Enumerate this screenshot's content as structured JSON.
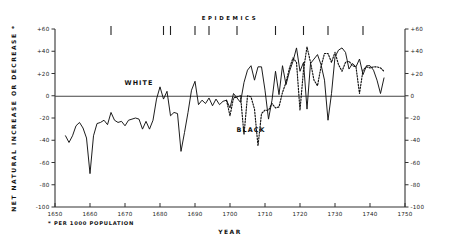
{
  "chart_data": {
    "type": "line",
    "title": "",
    "xlabel": "YEAR",
    "ylabel": "NET NATURAL INCREASE OR DECREASE *",
    "footnote": "* PER 1000 POPULATION",
    "annotation_epidemics_label": "EPIDEMICS",
    "xlim": [
      1650,
      1750
    ],
    "ylim": [
      -100,
      60
    ],
    "xticks": [
      1650,
      1660,
      1670,
      1680,
      1690,
      1700,
      1710,
      1720,
      1730,
      1740,
      1750
    ],
    "xticklabels": [
      "1650",
      "1660",
      "1670",
      "1680",
      "1690",
      "1700",
      "1710",
      "1720",
      "1730",
      "1740",
      "1750"
    ],
    "yticks": [
      60,
      40,
      20,
      0,
      -20,
      -40,
      -60,
      -80,
      -100
    ],
    "yticklabels": [
      "+60",
      "+40",
      "+20",
      "0",
      "-20",
      "-40",
      "-60",
      "-80",
      "-100"
    ],
    "right_axis_yticklabels": [
      "+60",
      "+40",
      "+20",
      "0",
      "-20",
      "-40",
      "-60",
      "-80",
      "-100"
    ],
    "grid": false,
    "legend_position": "inline-labels",
    "zero_line": 0,
    "epidemic_years": [
      1666,
      1681,
      1683,
      1690,
      1694,
      1702,
      1713,
      1721,
      1728,
      1738
    ],
    "series": [
      {
        "name": "WHITE",
        "style": "solid",
        "color": "#111111",
        "label_x": 1674,
        "label_y": 10,
        "x": [
          1653,
          1654,
          1655,
          1656,
          1657,
          1658,
          1659,
          1660,
          1661,
          1662,
          1663,
          1664,
          1665,
          1666,
          1667,
          1668,
          1669,
          1670,
          1671,
          1672,
          1673,
          1674,
          1675,
          1676,
          1677,
          1678,
          1679,
          1680,
          1681,
          1682,
          1683,
          1684,
          1685,
          1686,
          1687,
          1688,
          1689,
          1690,
          1691,
          1692,
          1693,
          1694,
          1695,
          1696,
          1697,
          1698,
          1699,
          1700,
          1701,
          1702,
          1703,
          1704,
          1705,
          1706,
          1707,
          1708,
          1709,
          1710,
          1711,
          1712,
          1713,
          1714,
          1715,
          1716,
          1717,
          1718,
          1719,
          1720,
          1721,
          1722,
          1723,
          1724,
          1725,
          1726,
          1727,
          1728,
          1729,
          1730,
          1731,
          1732,
          1733,
          1734,
          1735,
          1736,
          1737,
          1738,
          1739,
          1740,
          1741,
          1742,
          1743,
          1744
        ],
        "y": [
          -36,
          -42,
          -36,
          -27,
          -24,
          -29,
          -38,
          -70,
          -36,
          -25,
          -24,
          -22,
          -26,
          -15,
          -22,
          -24,
          -23,
          -27,
          -22,
          -21,
          -20,
          -21,
          -30,
          -23,
          -30,
          -22,
          -3,
          8,
          -3,
          4,
          -18,
          -15,
          -16,
          -50,
          -33,
          -15,
          5,
          13,
          -8,
          -4,
          -7,
          -2,
          -9,
          -3,
          -8,
          -5,
          -4,
          -11,
          2,
          -2,
          -6,
          12,
          23,
          27,
          14,
          26,
          26,
          5,
          -21,
          -4,
          22,
          1,
          27,
          10,
          22,
          31,
          43,
          22,
          30,
          -12,
          29,
          33,
          37,
          28,
          14,
          -22,
          2,
          35,
          41,
          43,
          39,
          24,
          29,
          26,
          33,
          19,
          27,
          27,
          23,
          14,
          2,
          16
        ]
      },
      {
        "name": "BLACK",
        "style": "dotted",
        "color": "#111111",
        "label_x": 1706,
        "label_y": -33,
        "x": [
          1699,
          1700,
          1701,
          1702,
          1703,
          1704,
          1705,
          1706,
          1707,
          1708,
          1709,
          1710,
          1711,
          1712,
          1713,
          1714,
          1715,
          1716,
          1717,
          1718,
          1719,
          1720,
          1721,
          1722,
          1723,
          1724,
          1725,
          1726,
          1727,
          1728,
          1729,
          1730,
          1731,
          1732,
          1733,
          1734,
          1735,
          1736,
          1737,
          1738,
          1739,
          1740,
          1741,
          1742,
          1743,
          1744
        ],
        "y": [
          -4,
          -18,
          -2,
          -1,
          0,
          -35,
          0,
          -1,
          -12,
          -45,
          -16,
          -13,
          -13,
          -7,
          -11,
          -10,
          3,
          12,
          25,
          34,
          30,
          -13,
          23,
          44,
          30,
          14,
          9,
          26,
          38,
          38,
          30,
          39,
          28,
          22,
          30,
          31,
          27,
          26,
          2,
          23,
          26,
          25,
          26,
          26,
          25,
          22
        ]
      }
    ]
  },
  "axes": {
    "left_axis_name": "left-value-axis",
    "right_axis_name": "right-value-axis",
    "bottom_axis_name": "year-axis"
  }
}
